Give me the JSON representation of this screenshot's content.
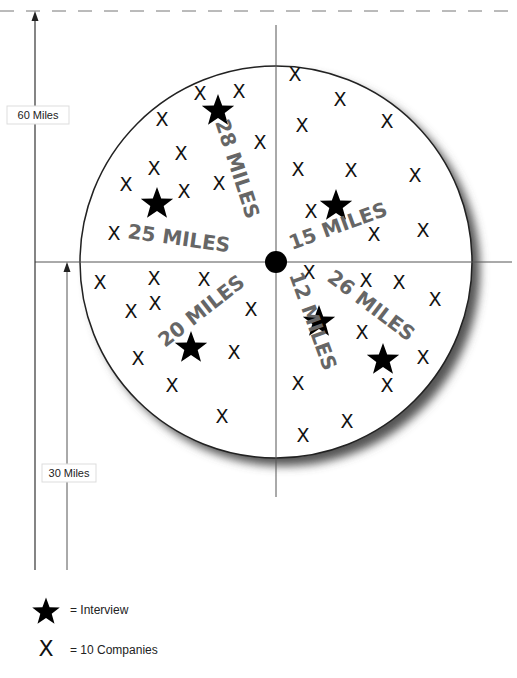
{
  "diagram": {
    "type": "radial-distance-map",
    "colors": {
      "line": "#333333",
      "label_gray": "#666666",
      "marker": "#111111",
      "shadow": "#555555"
    },
    "scale_markers": [
      {
        "label": "60 Miles"
      },
      {
        "label": "30 Miles"
      }
    ],
    "distance_labels": [
      {
        "label": "28 MILES",
        "quadrant": "upper-left"
      },
      {
        "label": "25 MILES",
        "quadrant": "upper-left"
      },
      {
        "label": "15 MILES",
        "quadrant": "upper-right"
      },
      {
        "label": "20 MILES",
        "quadrant": "lower-left"
      },
      {
        "label": "12 MILES",
        "quadrant": "lower-right"
      },
      {
        "label": "26 MILES",
        "quadrant": "lower-right"
      }
    ],
    "company_marker_glyph": "X",
    "interview_count": 6,
    "company_marker_count": 43
  },
  "legend": {
    "items": [
      {
        "icon": "star-icon",
        "label": "= Interview"
      },
      {
        "icon": "x-icon",
        "glyph": "X",
        "label": "= 10 Companies"
      }
    ]
  }
}
